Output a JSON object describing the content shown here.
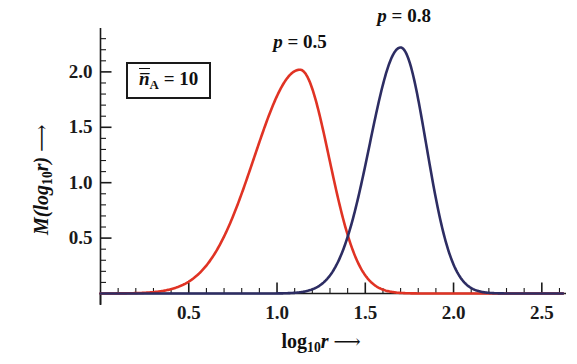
{
  "chart_data": {
    "type": "line",
    "title": "",
    "subtitle": "",
    "xlabel": "log10 r",
    "ylabel": "M(log10 r)",
    "xlabel_display": "log",
    "xlabel_sub": "10",
    "xlabel_var": "r",
    "ylabel_display": "M(log",
    "ylabel_sub": "10",
    "ylabel_var": "r)",
    "arrow": "⟶",
    "xlim": [
      0.0,
      2.62
    ],
    "ylim": [
      0.0,
      2.36
    ],
    "grid": false,
    "legend_position": "inline-annotations",
    "x_tick_labels": [
      "0.5",
      "1.0",
      "1.5",
      "2.0",
      "2.5"
    ],
    "x_tick_values": [
      0.5,
      1.0,
      1.5,
      2.0,
      2.5
    ],
    "x_minor_step": 0.1,
    "y_tick_labels": [
      "0.5",
      "1.0",
      "1.5",
      "2.0"
    ],
    "y_tick_values": [
      0.5,
      1.0,
      1.5,
      2.0
    ],
    "y_minor_step": 0.1,
    "annotations": [
      {
        "name": "parameter-box",
        "text": "n̅",
        "sub": "A",
        "equals": " = ",
        "value": "10",
        "full_text": "n̅_A = 10",
        "boxed": true
      }
    ],
    "series": [
      {
        "name": "p = 0.5",
        "label_prefix": "p",
        "label_equals": " = ",
        "label_value": "0.5",
        "color": "#e03324",
        "peak_x": 1.13,
        "peak_y": 2.02,
        "sigma_left": 0.26,
        "sigma_right": 0.165,
        "label_pos_x": 1.13,
        "label_pos_y": 2.26,
        "x": [
          0.0,
          0.1,
          0.2,
          0.3,
          0.4,
          0.5,
          0.55,
          0.6,
          0.65,
          0.7,
          0.75,
          0.8,
          0.85,
          0.9,
          0.95,
          1.0,
          1.05,
          1.1,
          1.13,
          1.15,
          1.2,
          1.25,
          1.3,
          1.35,
          1.4,
          1.45,
          1.5,
          1.55,
          1.6,
          1.65,
          1.7,
          1.8,
          1.9,
          2.0,
          2.2,
          2.4,
          2.6
        ],
        "y": [
          0.0,
          0.0,
          0.01,
          0.02,
          0.05,
          0.11,
          0.16,
          0.23,
          0.32,
          0.44,
          0.58,
          0.76,
          0.96,
          1.18,
          1.41,
          1.63,
          1.83,
          1.97,
          2.02,
          2.01,
          1.91,
          1.7,
          1.4,
          1.07,
          0.75,
          0.48,
          0.28,
          0.15,
          0.07,
          0.03,
          0.01,
          0.0,
          0.0,
          0.0,
          0.0,
          0.0,
          0.0
        ]
      },
      {
        "name": "p = 0.8",
        "label_prefix": "p",
        "label_equals": " = ",
        "label_value": "0.8",
        "color": "#2d2d63",
        "peak_x": 1.7,
        "peak_y": 2.22,
        "sigma_left": 0.175,
        "sigma_right": 0.145,
        "label_pos_x": 1.72,
        "label_pos_y": 2.5,
        "x": [
          0.0,
          0.3,
          0.6,
          0.8,
          0.9,
          1.0,
          1.1,
          1.15,
          1.2,
          1.25,
          1.3,
          1.35,
          1.4,
          1.45,
          1.5,
          1.55,
          1.6,
          1.65,
          1.7,
          1.75,
          1.8,
          1.85,
          1.9,
          1.95,
          2.0,
          2.05,
          2.1,
          2.15,
          2.2,
          2.3,
          2.4,
          2.5,
          2.6
        ],
        "y": [
          0.0,
          0.0,
          0.0,
          0.01,
          0.02,
          0.04,
          0.09,
          0.13,
          0.19,
          0.28,
          0.4,
          0.56,
          0.77,
          1.02,
          1.31,
          1.61,
          1.89,
          2.1,
          2.22,
          2.21,
          2.08,
          1.83,
          1.5,
          1.13,
          0.78,
          0.48,
          0.26,
          0.13,
          0.06,
          0.01,
          0.0,
          0.0,
          0.0
        ]
      }
    ]
  },
  "axis": {
    "x_label_text": "log",
    "y_label_text": "M(log"
  }
}
